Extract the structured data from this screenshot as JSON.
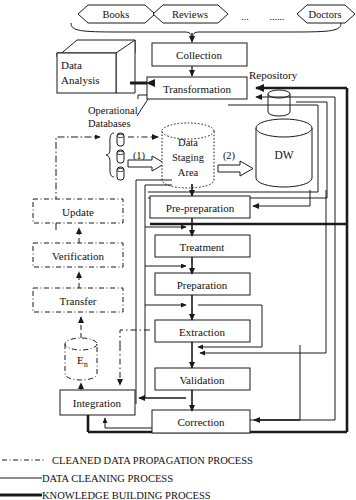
{
  "diagram": {
    "sources": [
      {
        "label": "Books"
      },
      {
        "label": "Reviews"
      },
      {
        "label": "..."
      },
      {
        "label": "......"
      },
      {
        "label": "Doctors"
      }
    ],
    "nodes": {
      "data_analysis": "Data\nAnalysis",
      "data_analysis_line1": "Data",
      "data_analysis_line2": "Analysis",
      "collection": "Collection",
      "transformation": "Transformation",
      "repository": "Repository",
      "operational_databases_line1": "Operational",
      "operational_databases_line2": "Databases",
      "staging_line1": "Data",
      "staging_line2": "Staging",
      "staging_line3": "Area",
      "dw": "DW",
      "step1": "(1)",
      "step2": "(2)",
      "pre_preparation": "Pre-preparation",
      "treatment": "Treatment",
      "preparation": "Preparation",
      "extraction": "Extraction",
      "validation": "Validation",
      "correction": "Correction",
      "integration": "Integration",
      "update": "Update",
      "verification": "Verification",
      "transfer": "Transfer",
      "en_base": "E",
      "en_sub": "n"
    },
    "legend": [
      {
        "style": "dash-dot",
        "label": "CLEANED DATA PROPAGATION PROCESS"
      },
      {
        "style": "thin-line",
        "label": "DATA CLEANING PROCESS"
      },
      {
        "style": "thick-line",
        "label": "KNOWLEDGE BUILDING PROCESS"
      }
    ],
    "colors": {
      "stroke": "#1a1a1a",
      "background": "#ffffff",
      "text": "#111111"
    }
  }
}
